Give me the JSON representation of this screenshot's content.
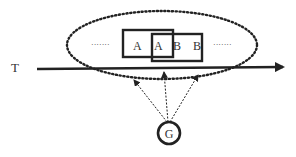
{
  "diagram": {
    "axis_label": "T",
    "boxes": [
      {
        "id": "box-left",
        "letters": [
          "A",
          "A"
        ]
      },
      {
        "id": "box-right",
        "letters": [
          "B",
          "B"
        ]
      }
    ],
    "letters": [
      "A",
      "A",
      "B",
      "B"
    ],
    "ellipsis_left": "·······",
    "ellipsis_right": "·······",
    "source_node": "G",
    "arrows_from_source": 3
  },
  "colors": {
    "stroke": "#222222",
    "text": "#333333",
    "background": "#ffffff"
  }
}
